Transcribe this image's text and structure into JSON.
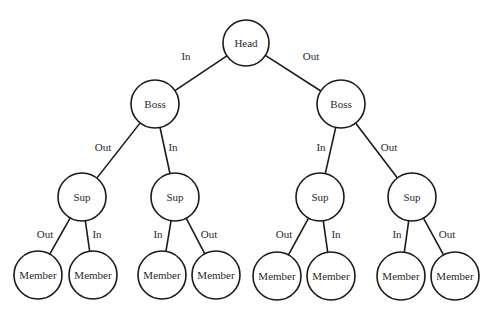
{
  "diagram": {
    "type": "binary-tree",
    "colors": {
      "stroke": "#1a1a1a",
      "text": "#2a2a2a",
      "background": "#ffffff"
    },
    "nodes": [
      {
        "id": "head",
        "label": "Head",
        "x": 246,
        "y": 43,
        "r": 23
      },
      {
        "id": "boss1",
        "label": "Boss",
        "x": 155,
        "y": 104,
        "r": 24
      },
      {
        "id": "boss2",
        "label": "Boss",
        "x": 341,
        "y": 104,
        "r": 24
      },
      {
        "id": "sup1",
        "label": "Sup",
        "x": 82,
        "y": 197,
        "r": 24
      },
      {
        "id": "sup2",
        "label": "Sup",
        "x": 175,
        "y": 197,
        "r": 24
      },
      {
        "id": "sup3",
        "label": "Sup",
        "x": 320,
        "y": 197,
        "r": 24
      },
      {
        "id": "sup4",
        "label": "Sup",
        "x": 412,
        "y": 197,
        "r": 24
      },
      {
        "id": "m1",
        "label": "Member",
        "x": 38,
        "y": 275,
        "r": 24
      },
      {
        "id": "m2",
        "label": "Member",
        "x": 93,
        "y": 275,
        "r": 24
      },
      {
        "id": "m3",
        "label": "Member",
        "x": 162,
        "y": 275,
        "r": 24
      },
      {
        "id": "m4",
        "label": "Member",
        "x": 216,
        "y": 275,
        "r": 24
      },
      {
        "id": "m5",
        "label": "Member",
        "x": 277,
        "y": 276,
        "r": 24
      },
      {
        "id": "m6",
        "label": "Member",
        "x": 331,
        "y": 276,
        "r": 24
      },
      {
        "id": "m7",
        "label": "Member",
        "x": 401,
        "y": 276,
        "r": 24
      },
      {
        "id": "m8",
        "label": "Member",
        "x": 455,
        "y": 276,
        "r": 24
      }
    ],
    "edges": [
      {
        "from": "head",
        "to": "boss1",
        "label": "In",
        "lx": 186,
        "ly": 57
      },
      {
        "from": "head",
        "to": "boss2",
        "label": "Out",
        "lx": 311,
        "ly": 57
      },
      {
        "from": "boss1",
        "to": "sup1",
        "label": "Out",
        "lx": 103,
        "ly": 148
      },
      {
        "from": "boss1",
        "to": "sup2",
        "label": "In",
        "lx": 173,
        "ly": 148
      },
      {
        "from": "boss2",
        "to": "sup3",
        "label": "In",
        "lx": 321,
        "ly": 148
      },
      {
        "from": "boss2",
        "to": "sup4",
        "label": "Out",
        "lx": 389,
        "ly": 148
      },
      {
        "from": "sup1",
        "to": "m1",
        "label": "Out",
        "lx": 45,
        "ly": 235
      },
      {
        "from": "sup1",
        "to": "m2",
        "label": "In",
        "lx": 97,
        "ly": 235
      },
      {
        "from": "sup2",
        "to": "m3",
        "label": "In",
        "lx": 158,
        "ly": 235
      },
      {
        "from": "sup2",
        "to": "m4",
        "label": "Out",
        "lx": 209,
        "ly": 235
      },
      {
        "from": "sup3",
        "to": "m5",
        "label": "Out",
        "lx": 284,
        "ly": 235
      },
      {
        "from": "sup3",
        "to": "m6",
        "label": "In",
        "lx": 336,
        "ly": 235
      },
      {
        "from": "sup4",
        "to": "m7",
        "label": "In",
        "lx": 397,
        "ly": 235
      },
      {
        "from": "sup4",
        "to": "m8",
        "label": "Out",
        "lx": 447,
        "ly": 235
      }
    ]
  }
}
